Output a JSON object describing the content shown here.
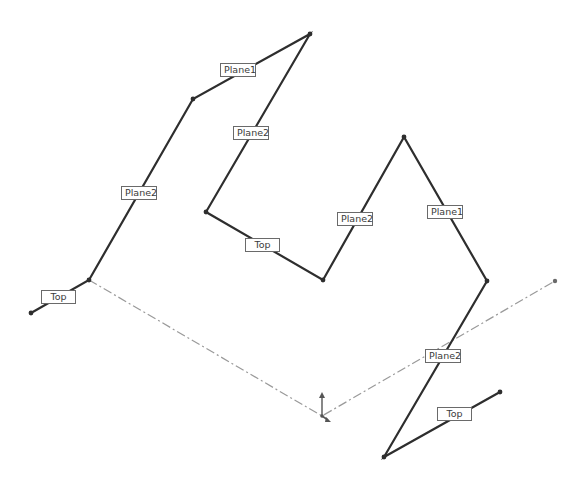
{
  "diagram": {
    "type": "3D sketch with plane relations",
    "colors": {
      "sketch_line": "#2e2e2e",
      "construction_line": "#9a9a9a",
      "label_border": "#6a6a6a",
      "label_text": "#3a3a3a",
      "background": "#ffffff"
    },
    "polyline_left": {
      "points": [
        [
          31,
          313
        ],
        [
          89,
          280
        ],
        [
          193,
          99
        ],
        [
          310,
          34
        ],
        [
          206,
          212
        ],
        [
          323,
          280
        ],
        [
          404,
          137
        ],
        [
          487,
          281
        ],
        [
          384,
          457
        ],
        [
          500,
          392
        ]
      ]
    },
    "construction_line": {
      "points": [
        [
          89,
          280
        ],
        [
          322,
          416
        ],
        [
          555,
          281
        ]
      ]
    },
    "origin": {
      "x": 322,
      "y": 416
    },
    "labels": [
      {
        "text": "Top",
        "x": 41,
        "y": 290,
        "w": 35
      },
      {
        "text": "Plane2",
        "x": 121,
        "y": 186,
        "w": 36
      },
      {
        "text": "Plane1",
        "x": 220,
        "y": 63,
        "w": 36
      },
      {
        "text": "Plane2",
        "x": 233,
        "y": 126,
        "w": 36
      },
      {
        "text": "Top",
        "x": 245,
        "y": 238,
        "w": 35
      },
      {
        "text": "Plane2",
        "x": 337,
        "y": 212,
        "w": 36
      },
      {
        "text": "Plane1",
        "x": 427,
        "y": 205,
        "w": 36
      },
      {
        "text": "Plane2",
        "x": 425,
        "y": 349,
        "w": 36
      },
      {
        "text": "Top",
        "x": 437,
        "y": 407,
        "w": 35
      }
    ]
  }
}
